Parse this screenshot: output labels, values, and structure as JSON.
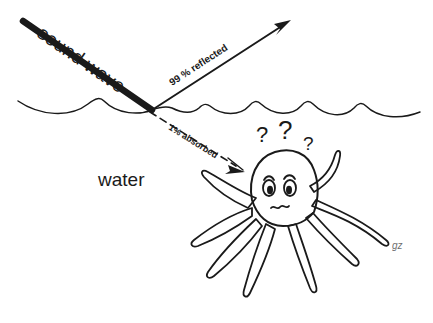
{
  "diagram": {
    "background_color": "#ffffff",
    "ink_color": "#1a1a1a",
    "labels": {
      "sound_wave": "sound wave",
      "reflected": "99 % reflected",
      "absorbed": "1% absorbed",
      "water": "water",
      "signature": "gz"
    },
    "question_marks": [
      {
        "glyph": "?",
        "size": 22
      },
      {
        "glyph": "?",
        "size": 26
      },
      {
        "glyph": "?",
        "size": 19
      }
    ],
    "elements": {
      "incoming_ray_name": "sound-wave-ray",
      "reflected_ray_name": "reflected-ray",
      "absorbed_ray_name": "absorbed-ray",
      "surface_name": "water-surface-line",
      "creature_name": "confused-octopus"
    }
  }
}
